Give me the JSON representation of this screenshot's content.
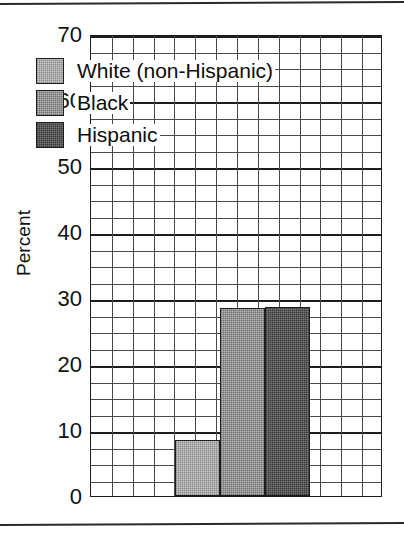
{
  "chart_data": {
    "type": "bar",
    "title": "",
    "xlabel": "",
    "ylabel": "Percent",
    "ylim": [
      0,
      70
    ],
    "ytick_labels": [
      "0",
      "10",
      "20",
      "30",
      "40",
      "50",
      "60",
      "70"
    ],
    "ytick_values": [
      0,
      10,
      20,
      30,
      40,
      50,
      60,
      70
    ],
    "minor_gridline_step": 2.5,
    "grid": true,
    "legend_position": "upper-left-inside",
    "categories": [
      "White (non-Hispanic)",
      "Black",
      "Hispanic"
    ],
    "values": [
      8.5,
      28.5,
      28.7
    ],
    "series": [
      {
        "name": "White (non-Hispanic)",
        "value": 8.5,
        "color": "#c9c9c9",
        "texture": "light-dither"
      },
      {
        "name": "Black",
        "value": 28.5,
        "color": "#b6b6b6",
        "texture": "medium-dither"
      },
      {
        "name": "Hispanic",
        "value": 28.7,
        "color": "#7a7a7a",
        "texture": "dark-dither"
      }
    ]
  },
  "legend": {
    "entries": [
      {
        "label": "White (non-Hispanic)",
        "swatch": "light-gray-swatch"
      },
      {
        "label": "Black",
        "swatch": "medium-gray-swatch"
      },
      {
        "label": "Hispanic",
        "swatch": "dark-gray-swatch"
      }
    ]
  },
  "axis": {
    "y_title": "Percent"
  }
}
